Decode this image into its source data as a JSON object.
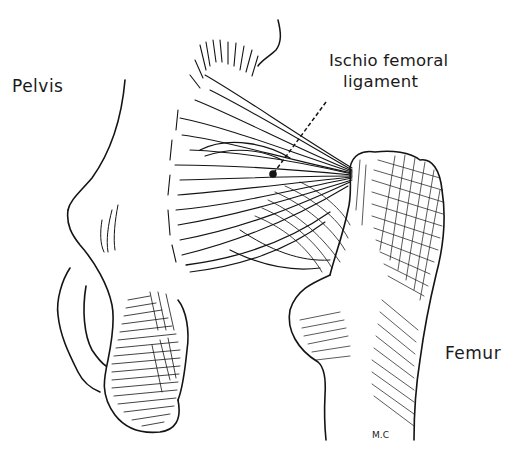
{
  "figure": {
    "ink_color": "#141414",
    "background_color": "#ffffff"
  },
  "labels": {
    "pelvis": "Pelvis",
    "ligament_line1": "Ischio femoral",
    "ligament_line2": "ligament",
    "femur": "Femur"
  },
  "signature": "M.C",
  "pointer": {
    "style": "dashed leader line",
    "from": [
      326,
      102
    ],
    "to": [
      273,
      174
    ],
    "dot": [
      273,
      174
    ]
  }
}
